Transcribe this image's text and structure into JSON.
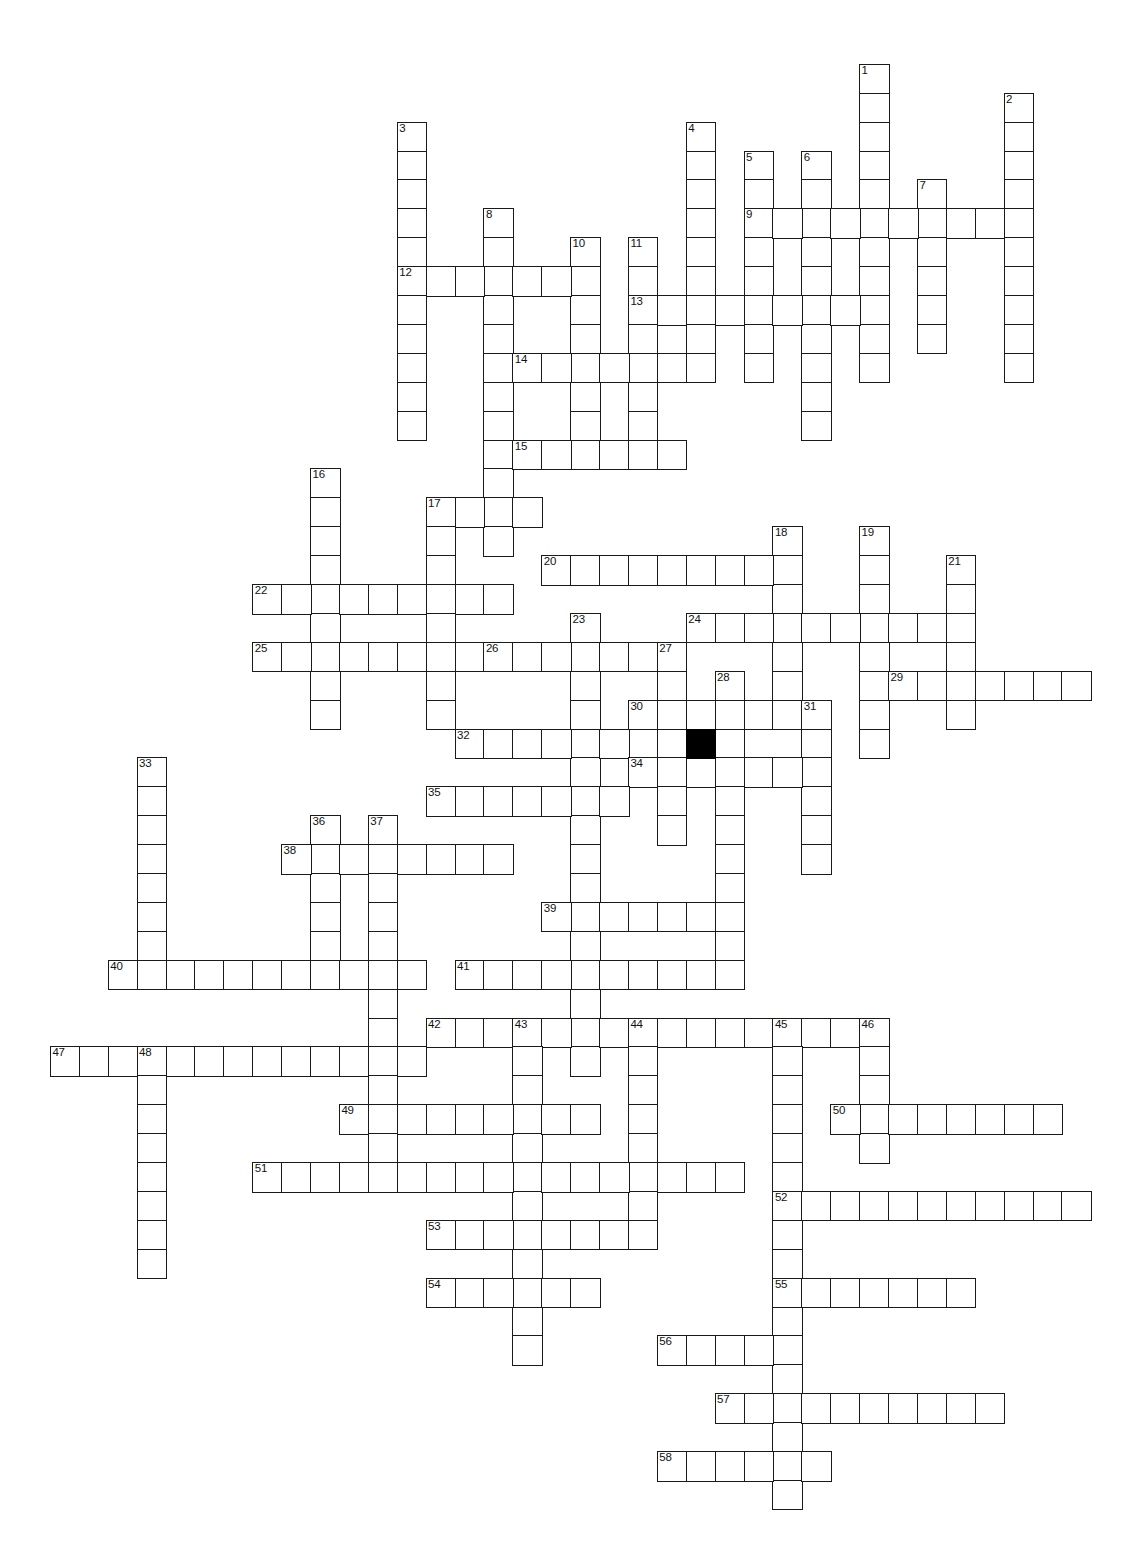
{
  "puzzle": {
    "title": "",
    "cell_size": 28.9,
    "origin_x": 21,
    "origin_y": 6,
    "grid_cols": 38,
    "grid_rows": 53,
    "block_color": "#000000",
    "line_color": "#1a1a1a",
    "background_color": "#ffffff",
    "block_cells": [
      [
        23,
        25
      ]
    ],
    "entries": [
      {
        "number": "1",
        "dir": "down",
        "col": 29,
        "row": 2,
        "length": 11
      },
      {
        "number": "2",
        "dir": "down",
        "col": 34,
        "row": 3,
        "length": 10
      },
      {
        "number": "3",
        "dir": "down",
        "col": 13,
        "row": 4,
        "length": 11
      },
      {
        "number": "4",
        "dir": "down",
        "col": 23,
        "row": 4,
        "length": 9
      },
      {
        "number": "5",
        "dir": "down",
        "col": 25,
        "row": 5,
        "length": 8
      },
      {
        "number": "6",
        "dir": "down",
        "col": 27,
        "row": 5,
        "length": 10
      },
      {
        "number": "7",
        "dir": "down",
        "col": 31,
        "row": 6,
        "length": 6
      },
      {
        "number": "8",
        "dir": "down",
        "col": 16,
        "row": 7,
        "length": 12
      },
      {
        "number": "9",
        "dir": "across",
        "col": 25,
        "row": 7,
        "length": 10
      },
      {
        "number": "10",
        "dir": "down",
        "col": 19,
        "row": 8,
        "length": 8
      },
      {
        "number": "11",
        "dir": "down",
        "col": 21,
        "row": 8,
        "length": 7
      },
      {
        "number": "12",
        "dir": "across",
        "col": 13,
        "row": 9,
        "length": 7
      },
      {
        "number": "13",
        "dir": "across",
        "col": 21,
        "row": 10,
        "length": 8
      },
      {
        "number": "14",
        "dir": "across",
        "col": 17,
        "row": 12,
        "length": 7
      },
      {
        "number": "15",
        "dir": "across",
        "col": 17,
        "row": 15,
        "length": 6
      },
      {
        "number": "16",
        "dir": "down",
        "col": 10,
        "row": 16,
        "length": 9
      },
      {
        "number": "17",
        "dir": "across",
        "col": 14,
        "row": 17,
        "length": 4
      },
      {
        "number": "17",
        "dir": "down",
        "col": 14,
        "row": 17,
        "length": 8
      },
      {
        "number": "18",
        "dir": "down",
        "col": 26,
        "row": 18,
        "length": 6
      },
      {
        "number": "19",
        "dir": "down",
        "col": 29,
        "row": 18,
        "length": 8
      },
      {
        "number": "20",
        "dir": "across",
        "col": 18,
        "row": 19,
        "length": 8
      },
      {
        "number": "21",
        "dir": "down",
        "col": 32,
        "row": 19,
        "length": 6
      },
      {
        "number": "22",
        "dir": "across",
        "col": 8,
        "row": 20,
        "length": 9
      },
      {
        "number": "23",
        "dir": "down",
        "col": 19,
        "row": 21,
        "length": 16
      },
      {
        "number": "24",
        "dir": "across",
        "col": 23,
        "row": 21,
        "length": 10
      },
      {
        "number": "25",
        "dir": "across",
        "col": 8,
        "row": 22,
        "length": 9
      },
      {
        "number": "26",
        "dir": "across",
        "col": 16,
        "row": 22,
        "length": 6
      },
      {
        "number": "27",
        "dir": "down",
        "col": 22,
        "row": 22,
        "length": 7
      },
      {
        "number": "28",
        "dir": "down",
        "col": 24,
        "row": 23,
        "length": 11
      },
      {
        "number": "29",
        "dir": "across",
        "col": 30,
        "row": 23,
        "length": 7
      },
      {
        "number": "30",
        "dir": "across",
        "col": 21,
        "row": 24,
        "length": 7
      },
      {
        "number": "31",
        "dir": "down",
        "col": 27,
        "row": 24,
        "length": 6
      },
      {
        "number": "32",
        "dir": "across",
        "col": 15,
        "row": 25,
        "length": 6
      },
      {
        "number": "33",
        "dir": "down",
        "col": 4,
        "row": 26,
        "length": 8
      },
      {
        "number": "34",
        "dir": "across",
        "col": 21,
        "row": 26,
        "length": 6
      },
      {
        "number": "35",
        "dir": "across",
        "col": 14,
        "row": 27,
        "length": 7
      },
      {
        "number": "36",
        "dir": "down",
        "col": 10,
        "row": 28,
        "length": 5
      },
      {
        "number": "37",
        "dir": "down",
        "col": 12,
        "row": 28,
        "length": 13
      },
      {
        "number": "38",
        "dir": "across",
        "col": 9,
        "row": 29,
        "length": 8
      },
      {
        "number": "39",
        "dir": "across",
        "col": 18,
        "row": 31,
        "length": 6
      },
      {
        "number": "40",
        "dir": "across",
        "col": 3,
        "row": 33,
        "length": 11
      },
      {
        "number": "41",
        "dir": "across",
        "col": 15,
        "row": 33,
        "length": 10
      },
      {
        "number": "42",
        "dir": "across",
        "col": 14,
        "row": 35,
        "length": 16
      },
      {
        "number": "43",
        "dir": "down",
        "col": 17,
        "row": 35,
        "length": 12
      },
      {
        "number": "44",
        "dir": "down",
        "col": 21,
        "row": 35,
        "length": 7
      },
      {
        "number": "45",
        "dir": "down",
        "col": 26,
        "row": 35,
        "length": 17
      },
      {
        "number": "46",
        "dir": "down",
        "col": 29,
        "row": 35,
        "length": 5
      },
      {
        "number": "47",
        "dir": "across",
        "col": 1,
        "row": 36,
        "length": 13
      },
      {
        "number": "48",
        "dir": "down",
        "col": 4,
        "row": 36,
        "length": 8
      },
      {
        "number": "49",
        "dir": "across",
        "col": 11,
        "row": 38,
        "length": 9
      },
      {
        "number": "50",
        "dir": "across",
        "col": 28,
        "row": 38,
        "length": 8
      },
      {
        "number": "51",
        "dir": "across",
        "col": 8,
        "row": 40,
        "length": 17
      },
      {
        "number": "52",
        "dir": "across",
        "col": 26,
        "row": 41,
        "length": 11
      },
      {
        "number": "53",
        "dir": "across",
        "col": 14,
        "row": 42,
        "length": 8
      },
      {
        "number": "54",
        "dir": "across",
        "col": 14,
        "row": 44,
        "length": 6
      },
      {
        "number": "55",
        "dir": "across",
        "col": 26,
        "row": 44,
        "length": 7
      },
      {
        "number": "56",
        "dir": "across",
        "col": 22,
        "row": 46,
        "length": 5
      },
      {
        "number": "57",
        "dir": "across",
        "col": 24,
        "row": 48,
        "length": 10
      },
      {
        "number": "58",
        "dir": "across",
        "col": 22,
        "row": 50,
        "length": 6
      }
    ]
  }
}
